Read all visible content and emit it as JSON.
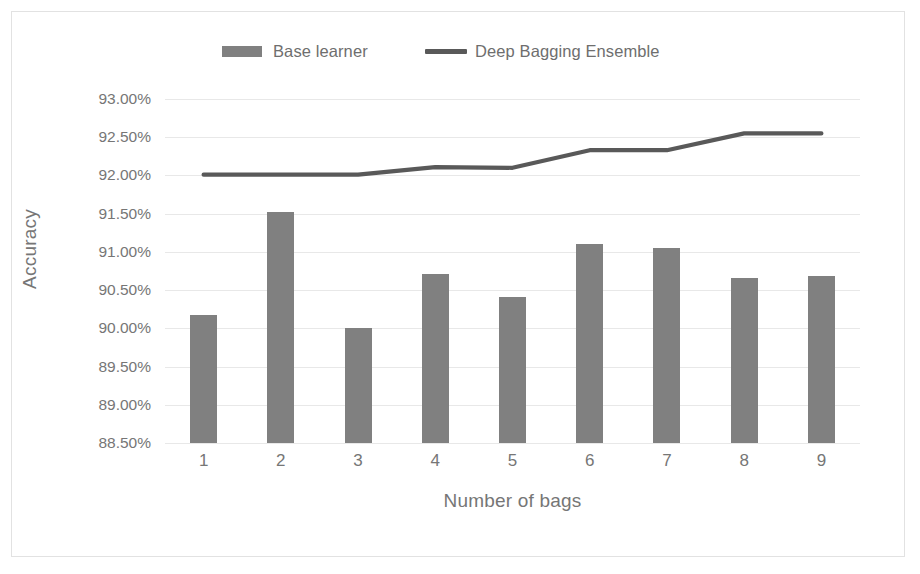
{
  "chart_data": {
    "type": "bar",
    "title": "",
    "xlabel": "Number of bags",
    "ylabel": "Accuracy",
    "categories": [
      "1",
      "2",
      "3",
      "4",
      "5",
      "6",
      "7",
      "8",
      "9"
    ],
    "ytick_labels": [
      "93.00%",
      "92.50%",
      "92.00%",
      "91.50%",
      "91.00%",
      "90.50%",
      "90.00%",
      "89.50%",
      "89.00%",
      "88.50%"
    ],
    "ytick_values": [
      93.0,
      92.5,
      92.0,
      91.5,
      91.0,
      90.5,
      90.0,
      89.5,
      89.0,
      88.5
    ],
    "ylim": [
      88.5,
      93.0
    ],
    "grid": true,
    "legend_position": "top",
    "series": [
      {
        "name": "Base learner",
        "kind": "bar",
        "color": "#808080",
        "values": [
          90.18,
          91.52,
          90.0,
          90.71,
          90.41,
          91.1,
          91.05,
          90.66,
          90.68
        ]
      },
      {
        "name": "Deep Bagging Ensemble",
        "kind": "line",
        "color": "#595959",
        "values": [
          92.01,
          92.01,
          92.01,
          92.11,
          92.1,
          92.33,
          92.33,
          92.55,
          92.55
        ]
      }
    ]
  },
  "legend": {
    "base_learner_label": "Base learner",
    "ensemble_label": "Deep Bagging Ensemble"
  },
  "axes": {
    "x_title": "Number of bags",
    "y_title": "Accuracy"
  }
}
